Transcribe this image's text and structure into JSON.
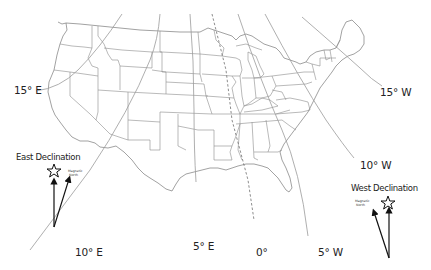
{
  "map": {
    "title": "",
    "subject": "Magnetic declination isogonic lines over the contiguous United States",
    "colors": {
      "state_lines": "#8c8c8c",
      "isogonic_lines": "#9a9a9a",
      "agonic_line": "#707070",
      "text": "#222222",
      "background": "#ffffff"
    },
    "isogonic_labels": [
      {
        "id": "15E",
        "text": "15° E"
      },
      {
        "id": "10E",
        "text": "10° E"
      },
      {
        "id": "5E",
        "text": "5° E"
      },
      {
        "id": "0",
        "text": "0°"
      },
      {
        "id": "5W",
        "text": "5° W"
      },
      {
        "id": "10W",
        "text": "10° W"
      },
      {
        "id": "15W",
        "text": "15° W"
      }
    ],
    "legends": {
      "east": {
        "title": "East Declination",
        "magnetic_north_line1": "Magnetic",
        "magnetic_north_line2": "North",
        "true_north_icon": "star-icon"
      },
      "west": {
        "title": "West Declination",
        "magnetic_north_line1": "Magnetic",
        "magnetic_north_line2": "North",
        "true_north_icon": "star-icon"
      }
    }
  }
}
